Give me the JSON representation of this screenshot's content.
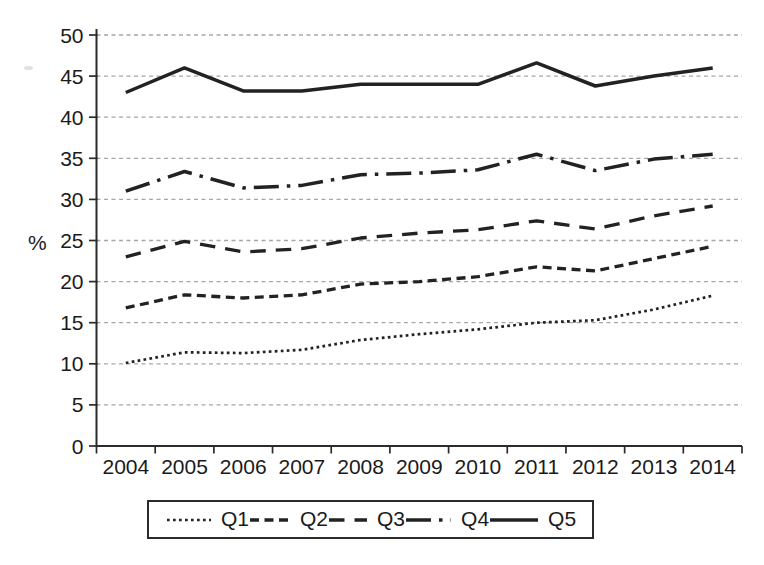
{
  "page": {
    "background": "#ffffff"
  },
  "colors": {
    "line": "#222222",
    "grid": "#a6a6a6",
    "axis": "#2b2b2b",
    "text": "#1a1a1a",
    "legend_border": "#2b2b2b",
    "background": "#ffffff"
  },
  "chart_data": {
    "type": "line",
    "title": "",
    "xlabel": "",
    "ylabel": "%",
    "x": [
      "2004",
      "2005",
      "2006",
      "2007",
      "2008",
      "2009",
      "2010",
      "2011",
      "2012",
      "2013",
      "2014"
    ],
    "ylim": [
      0,
      50
    ],
    "yticks": [
      0,
      5,
      10,
      15,
      20,
      25,
      30,
      35,
      40,
      45,
      50
    ],
    "grid": "horizontal dashed gray lines at every 5 units",
    "legend_position": "bottom boxed horizontal",
    "legend_entries": [
      "Q1",
      "Q2",
      "Q3",
      "Q4",
      "Q5"
    ],
    "series": [
      {
        "name": "Q1",
        "line_style": "dotted",
        "values": [
          10.1,
          11.4,
          11.3,
          11.7,
          12.9,
          13.6,
          14.2,
          15.0,
          15.3,
          16.6,
          18.3
        ]
      },
      {
        "name": "Q2",
        "line_style": "short-dash",
        "values": [
          16.8,
          18.4,
          18.0,
          18.4,
          19.7,
          20.0,
          20.6,
          21.8,
          21.3,
          22.8,
          24.3
        ]
      },
      {
        "name": "Q3",
        "line_style": "medium-dash",
        "values": [
          23.0,
          24.9,
          23.6,
          24.0,
          25.3,
          25.9,
          26.3,
          27.4,
          26.4,
          28.0,
          29.2
        ]
      },
      {
        "name": "Q4",
        "line_style": "long-dash-dot",
        "values": [
          31.0,
          33.4,
          31.4,
          31.7,
          33.0,
          33.2,
          33.6,
          35.5,
          33.5,
          34.9,
          35.5
        ]
      },
      {
        "name": "Q5",
        "line_style": "solid",
        "values": [
          43.0,
          46.0,
          43.2,
          43.2,
          44.0,
          44.0,
          44.0,
          46.6,
          43.8,
          45.0,
          46.0
        ]
      }
    ]
  }
}
